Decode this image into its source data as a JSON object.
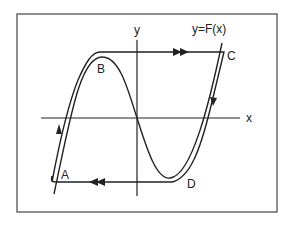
{
  "figure": {
    "curve_label": "y=F(x)",
    "axis_labels": {
      "x": "x",
      "y": "y"
    },
    "points": [
      {
        "id": "A",
        "label": "A"
      },
      {
        "id": "B",
        "label": "B"
      },
      {
        "id": "C",
        "label": "C"
      },
      {
        "id": "D",
        "label": "D"
      }
    ],
    "arrows": [
      {
        "segment": "left-branch",
        "direction": "up",
        "count": 1
      },
      {
        "segment": "top-jump B-to-C",
        "direction": "right",
        "count": 2
      },
      {
        "segment": "right-branch",
        "direction": "down",
        "count": 1
      },
      {
        "segment": "bottom-jump D-to-A",
        "direction": "left",
        "count": 2
      }
    ],
    "colors": {
      "stroke": "#222222",
      "background": "#ffffff",
      "frame": "#444444"
    }
  }
}
